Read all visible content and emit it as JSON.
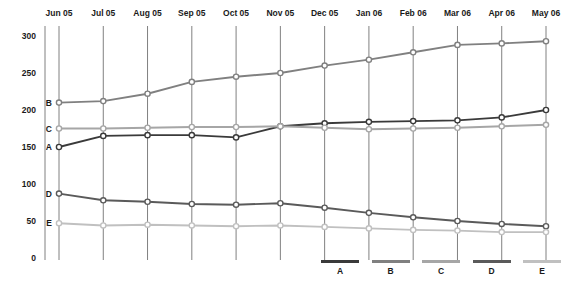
{
  "chart_data": {
    "type": "line",
    "title": "",
    "xlabel": "",
    "ylabel": "",
    "categories": [
      "Jun 05",
      "Jul 05",
      "Aug 05",
      "Sep 05",
      "Oct 05",
      "Nov 05",
      "Dec 05",
      "Jan 06",
      "Feb 06",
      "Mar 06",
      "Apr 06",
      "May 06"
    ],
    "ylim": [
      0,
      300
    ],
    "yticks": [
      0,
      50,
      100,
      150,
      200,
      250,
      300
    ],
    "ytick_labels": [
      "0",
      "50",
      "100",
      "150",
      "200",
      "250",
      "300"
    ],
    "grid": "vertical",
    "legend_position": "bottom-right",
    "marker": "circle-open",
    "series": [
      {
        "name": "A",
        "color": "#3a3a3a",
        "values": [
          150,
          165,
          166,
          166,
          163,
          178,
          182,
          184,
          185,
          186,
          190,
          200
        ]
      },
      {
        "name": "B",
        "color": "#808080",
        "values": [
          210,
          212,
          222,
          238,
          245,
          250,
          260,
          268,
          278,
          288,
          290,
          293
        ]
      },
      {
        "name": "C",
        "color": "#a6a6a6",
        "values": [
          175,
          175,
          176,
          177,
          177,
          178,
          176,
          174,
          175,
          176,
          178,
          180
        ]
      },
      {
        "name": "D",
        "color": "#5a5a5a",
        "values": [
          87,
          78,
          76,
          73,
          72,
          74,
          68,
          61,
          55,
          50,
          46,
          43
        ]
      },
      {
        "name": "E",
        "color": "#c0c0c0",
        "values": [
          47,
          44,
          45,
          44,
          43,
          44,
          42,
          40,
          38,
          37,
          35,
          35
        ]
      }
    ]
  },
  "series_edge_labels": [
    {
      "name": "B",
      "value": 210
    },
    {
      "name": "C",
      "value": 175
    },
    {
      "name": "A",
      "value": 150
    },
    {
      "name": "D",
      "value": 87
    },
    {
      "name": "E",
      "value": 47
    }
  ],
  "legend": {
    "items": [
      {
        "label": "A",
        "color": "#3a3a3a"
      },
      {
        "label": "B",
        "color": "#808080"
      },
      {
        "label": "C",
        "color": "#a6a6a6"
      },
      {
        "label": "D",
        "color": "#5a5a5a"
      },
      {
        "label": "E",
        "color": "#c0c0c0"
      }
    ]
  },
  "axis_colors": {
    "gridline": "#808080",
    "axis": "#808080",
    "text": "#1a1a1a"
  }
}
